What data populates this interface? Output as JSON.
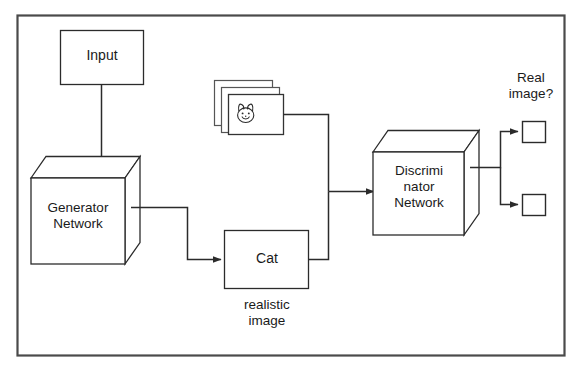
{
  "diagram": {
    "border_color": "#4a4a4a",
    "line_color": "#2b2b2b",
    "text_color": "#1a1a1a",
    "background": "#ffffff",
    "nodes": {
      "input_box": {
        "label": "Input"
      },
      "generator_cube": {
        "label": "Generator\nNetwork"
      },
      "discriminator_cube": {
        "label": "Discrimi\nnator\nNetwork"
      },
      "cat_box": {
        "label": "Cat"
      },
      "realistic_caption": {
        "label": "realistic\nimage"
      },
      "real_image_question": {
        "label": "Real\nimage?"
      },
      "image_stack": {
        "icon": "cat-face-icon",
        "count": 3
      },
      "output_box_top": {
        "label": ""
      },
      "output_box_bottom": {
        "label": ""
      }
    },
    "edges": [
      {
        "from": "input_box",
        "to": "generator_cube",
        "arrow": true
      },
      {
        "from": "generator_cube",
        "to": "cat_box",
        "arrow": true
      },
      {
        "from": "image_stack",
        "to": "discriminator_cube",
        "arrow": true
      },
      {
        "from": "cat_box",
        "to": "discriminator_cube",
        "arrow": true
      },
      {
        "from": "discriminator_cube",
        "to": "output_box_top",
        "arrow": true
      },
      {
        "from": "discriminator_cube",
        "to": "output_box_bottom",
        "arrow": true
      }
    ]
  }
}
